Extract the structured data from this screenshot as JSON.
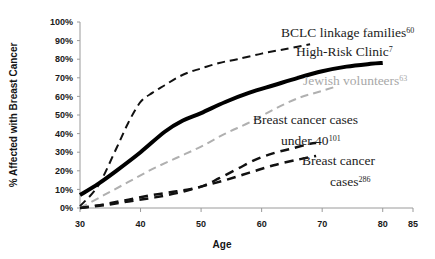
{
  "chart_data": {
    "type": "line",
    "title": "",
    "xlabel": "Age",
    "ylabel": "% Affected with Breast Cancer",
    "xlim": [
      30,
      85
    ],
    "ylim": [
      0,
      100
    ],
    "grid": false,
    "legend_position": "inline-annotations",
    "x_ticks": [
      "30",
      "40",
      "50",
      "60",
      "70",
      "80",
      "85"
    ],
    "x_tick_values": [
      30,
      40,
      50,
      60,
      70,
      80,
      85
    ],
    "y_ticks": [
      "0%",
      "10%",
      "20%",
      "30%",
      "40%",
      "50%",
      "60%",
      "70%",
      "80%",
      "90%",
      "100%"
    ],
    "y_tick_values": [
      0,
      10,
      20,
      30,
      40,
      50,
      60,
      70,
      80,
      90,
      100
    ],
    "series": [
      {
        "name": "BCLC linkage families",
        "reference": "60",
        "style": "dashed",
        "color": "#111111",
        "width": 2,
        "x": [
          30,
          33,
          36,
          38,
          40,
          42,
          44,
          46,
          48,
          50,
          53,
          56,
          60,
          64,
          68
        ],
        "values": [
          1,
          12,
          32,
          46,
          57,
          62,
          66,
          70,
          73,
          75,
          78,
          80,
          83,
          85.5,
          88
        ]
      },
      {
        "name": "High-Risk Clinic",
        "reference": "7",
        "style": "solid",
        "color": "#000000",
        "width": 4,
        "x": [
          30,
          33,
          36,
          40,
          44,
          47,
          50,
          54,
          58,
          62,
          66,
          70,
          74,
          78,
          80
        ],
        "values": [
          7,
          13,
          20,
          30,
          41,
          47,
          51,
          57,
          62,
          66,
          70,
          73.5,
          76,
          77.5,
          78
        ]
      },
      {
        "name": "Jewish volunteers",
        "reference": "63",
        "style": "dashed",
        "color": "#b0b0b0",
        "width": 2,
        "x": [
          30,
          34,
          38,
          42,
          46,
          50,
          54,
          58,
          62,
          66,
          70,
          72
        ],
        "values": [
          0,
          7,
          14,
          21,
          27,
          33,
          40,
          46,
          53,
          59,
          63,
          65
        ]
      },
      {
        "name": "Breast cancer cases under 40",
        "reference": "101",
        "style": "dashed",
        "color": "#111111",
        "width": 2.5,
        "x": [
          30,
          34,
          38,
          42,
          46,
          50,
          53,
          56,
          59,
          62,
          65,
          68,
          69
        ],
        "values": [
          0,
          2,
          4.5,
          7,
          9,
          11.5,
          16,
          21,
          26,
          29.5,
          32,
          34.5,
          35
        ]
      },
      {
        "name": "Breast cancer cases",
        "reference": "286",
        "style": "dashed",
        "color": "#111111",
        "width": 2.5,
        "x": [
          30,
          34,
          38,
          42,
          46,
          50,
          54,
          58,
          62,
          66,
          69
        ],
        "values": [
          0,
          1.5,
          3.5,
          5.5,
          8,
          11.5,
          15,
          19,
          23,
          26,
          28
        ]
      }
    ],
    "annotations": [
      {
        "id": "bclc",
        "text": "BCLC linkage families",
        "superscript": "60",
        "color": "#1c1c1c",
        "x": 281,
        "y": 37,
        "anchor": "start"
      },
      {
        "id": "high-risk-clinic",
        "text": "High-Risk Clinic",
        "superscript": "7",
        "color": "#1c1c1c",
        "x": 296,
        "y": 56,
        "anchor": "start"
      },
      {
        "id": "jewish-volunteers",
        "text": "Jewish volunteers",
        "superscript": "63",
        "color": "#a8a8a8",
        "x": 303,
        "y": 85,
        "anchor": "start"
      },
      {
        "id": "bc-cases-under-40-line1",
        "text": "Breast cancer cases",
        "superscript": "",
        "color": "#1c1c1c",
        "x": 253,
        "y": 124,
        "anchor": "start"
      },
      {
        "id": "bc-cases-under-40-line2",
        "text": "under 40",
        "superscript": "101",
        "color": "#1c1c1c",
        "x": 281,
        "y": 145,
        "anchor": "start"
      },
      {
        "id": "bc-cases-line1",
        "text": "Breast cancer",
        "superscript": "",
        "color": "#1c1c1c",
        "x": 302,
        "y": 165,
        "anchor": "start"
      },
      {
        "id": "bc-cases-line2",
        "text": "cases",
        "superscript": "286",
        "color": "#1c1c1c",
        "x": 330,
        "y": 186,
        "anchor": "start"
      }
    ]
  },
  "axes": {
    "x_title": "Age",
    "y_title": "% Affected with Breast Cancer"
  }
}
